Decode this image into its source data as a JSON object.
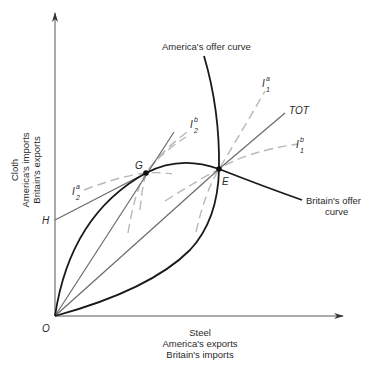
{
  "figure": {
    "type": "offer-curve-diagram",
    "y_axis": {
      "label_lines": [
        "Cloth",
        "America's imports",
        "Britain's exports"
      ]
    },
    "x_axis": {
      "label_lines": [
        "Steel",
        "America's exports",
        "Britain's imports"
      ]
    },
    "curves": {
      "america_offer": {
        "label": "America's offer curve"
      },
      "britain_offer": {
        "label_lines": [
          "Britain's offer",
          "curve"
        ]
      }
    },
    "lines": {
      "tot": {
        "label": "TOT"
      }
    },
    "points": {
      "origin": "O",
      "g": "G",
      "e": "E",
      "h": "H"
    },
    "indifference_curves": {
      "i1a": {
        "main": "I",
        "sub": "1",
        "sup": "a"
      },
      "i1b": {
        "main": "I",
        "sub": "1",
        "sup": "b"
      },
      "i2a": {
        "main": "I",
        "sub": "2",
        "sup": "a"
      },
      "i2b": {
        "main": "I",
        "sub": "2",
        "sup": "b"
      }
    },
    "colors": {
      "offer_curves": "#1a1a1a",
      "rays": "#6a6a6a",
      "indifference": "#b8b8b8",
      "axes": "#555555"
    }
  }
}
